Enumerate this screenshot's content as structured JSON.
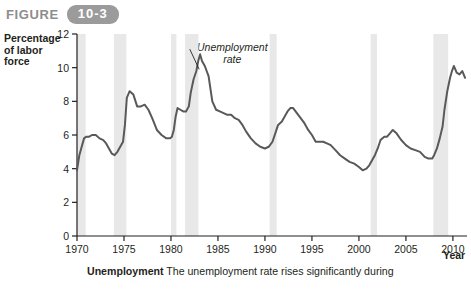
{
  "header": {
    "figure_word": "FIGURE",
    "figure_number": "10-3",
    "badge_color": "#9b9b9b"
  },
  "caption": {
    "bold_lead": "Unemployment",
    "text": " The unemployment rate rises significantly during"
  },
  "chart_data": {
    "type": "line",
    "title": "",
    "xlabel": "Year",
    "ylabel": "Percentage of labor force",
    "ylabel_lines": [
      "Percentage",
      "of labor",
      "force"
    ],
    "xlim": [
      1970,
      2011.5
    ],
    "ylim": [
      0,
      12
    ],
    "xticks": [
      1970,
      1975,
      1980,
      1985,
      1990,
      1995,
      2000,
      2005,
      2010
    ],
    "yticks": [
      0,
      2,
      4,
      6,
      8,
      10,
      12
    ],
    "grid": false,
    "legend": "none",
    "line_color": "#595959",
    "band_color": "#e8e8e8",
    "annotations": [
      {
        "text_lines": [
          "Unemployment",
          "rate"
        ],
        "x": 1983.5,
        "y": 10.6,
        "style": "italic"
      }
    ],
    "recession_bands": [
      {
        "start": 1969.92,
        "end": 1970.92
      },
      {
        "start": 1973.92,
        "end": 1975.25
      },
      {
        "start": 1980.0,
        "end": 1980.58
      },
      {
        "start": 1981.5,
        "end": 1982.92
      },
      {
        "start": 1990.5,
        "end": 1991.25
      },
      {
        "start": 2001.25,
        "end": 2001.92
      },
      {
        "start": 2007.92,
        "end": 2009.5
      }
    ],
    "series": [
      {
        "name": "Unemployment rate",
        "x": [
          1970.0,
          1970.25,
          1970.5,
          1970.75,
          1971.0,
          1971.3,
          1971.6,
          1972.0,
          1972.4,
          1972.8,
          1973.1,
          1973.4,
          1973.7,
          1974.0,
          1974.3,
          1974.6,
          1974.9,
          1975.1,
          1975.3,
          1975.6,
          1976.0,
          1976.4,
          1976.8,
          1977.2,
          1977.6,
          1978.0,
          1978.5,
          1979.0,
          1979.5,
          1979.9,
          1980.1,
          1980.3,
          1980.5,
          1980.7,
          1981.0,
          1981.3,
          1981.6,
          1981.9,
          1982.1,
          1982.4,
          1982.7,
          1982.9,
          1983.1,
          1983.3,
          1983.6,
          1984.0,
          1984.4,
          1984.8,
          1985.2,
          1985.6,
          1986.0,
          1986.4,
          1986.8,
          1987.2,
          1987.6,
          1988.0,
          1988.5,
          1989.0,
          1989.5,
          1990.0,
          1990.4,
          1990.8,
          1991.1,
          1991.4,
          1991.8,
          1992.1,
          1992.4,
          1992.7,
          1993.0,
          1993.4,
          1993.8,
          1994.2,
          1994.6,
          1995.0,
          1995.4,
          1995.8,
          1996.2,
          1996.6,
          1997.0,
          1997.5,
          1998.0,
          1998.5,
          1999.0,
          1999.5,
          2000.0,
          2000.4,
          2000.8,
          2001.1,
          2001.4,
          2001.7,
          2002.0,
          2002.3,
          2002.7,
          2003.0,
          2003.3,
          2003.6,
          2004.0,
          2004.5,
          2005.0,
          2005.5,
          2006.0,
          2006.5,
          2007.0,
          2007.4,
          2007.8,
          2008.0,
          2008.3,
          2008.6,
          2008.9,
          2009.1,
          2009.4,
          2009.7,
          2009.9,
          2010.1,
          2010.4,
          2010.7,
          2011.0,
          2011.3
        ],
        "y": [
          3.9,
          4.8,
          5.3,
          5.8,
          5.9,
          5.9,
          6.0,
          6.0,
          5.8,
          5.7,
          5.5,
          5.2,
          4.9,
          4.8,
          5.0,
          5.3,
          5.6,
          6.6,
          8.2,
          8.6,
          8.4,
          7.7,
          7.7,
          7.8,
          7.5,
          7.0,
          6.3,
          6.0,
          5.8,
          5.8,
          5.9,
          6.3,
          7.1,
          7.6,
          7.5,
          7.4,
          7.4,
          7.7,
          8.5,
          9.3,
          9.8,
          10.4,
          10.8,
          10.4,
          10.1,
          9.5,
          8.0,
          7.5,
          7.4,
          7.3,
          7.2,
          7.2,
          7.0,
          6.9,
          6.6,
          6.2,
          5.8,
          5.5,
          5.3,
          5.2,
          5.3,
          5.6,
          6.1,
          6.6,
          6.8,
          7.1,
          7.4,
          7.6,
          7.6,
          7.3,
          7.0,
          6.7,
          6.3,
          6.0,
          5.6,
          5.6,
          5.6,
          5.5,
          5.4,
          5.1,
          4.8,
          4.6,
          4.4,
          4.3,
          4.1,
          3.9,
          4.0,
          4.2,
          4.5,
          4.8,
          5.2,
          5.7,
          5.9,
          5.9,
          6.1,
          6.3,
          6.1,
          5.7,
          5.4,
          5.2,
          5.1,
          5.0,
          4.7,
          4.6,
          4.6,
          4.8,
          5.2,
          5.8,
          6.5,
          7.5,
          8.6,
          9.4,
          9.8,
          10.1,
          9.7,
          9.6,
          9.8,
          9.4
        ]
      }
    ]
  }
}
